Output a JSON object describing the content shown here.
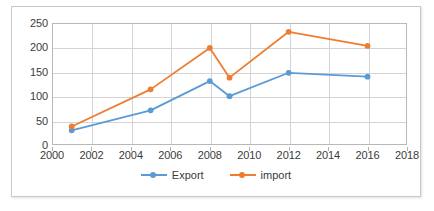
{
  "chart_data": {
    "type": "line",
    "title": "",
    "subtitle": "",
    "xlabel": "",
    "ylabel": "",
    "xlim": [
      2000,
      2018
    ],
    "ylim": [
      0,
      250
    ],
    "xticks": [
      2000,
      2002,
      2004,
      2006,
      2008,
      2010,
      2012,
      2014,
      2016,
      2018
    ],
    "yticks": [
      0,
      50,
      100,
      150,
      200,
      250
    ],
    "grid": "both",
    "legend_position": "bottom",
    "x": [
      2001,
      2005,
      2008,
      2009,
      2012,
      2016
    ],
    "series": [
      {
        "name": "Export",
        "color": "#5B9BD5",
        "values": [
          30,
          71,
          131,
          100,
          148,
          140
        ]
      },
      {
        "name": "import",
        "color": "#ED7D31",
        "values": [
          38,
          114,
          199,
          138,
          232,
          203
        ]
      }
    ]
  },
  "axes": {
    "y_tick_labels": [
      "250",
      "200",
      "150",
      "100",
      "50",
      "0"
    ],
    "x_tick_labels": [
      "2000",
      "2002",
      "2004",
      "2006",
      "2008",
      "2010",
      "2012",
      "2014",
      "2016",
      "2018"
    ]
  },
  "legend": {
    "items": [
      {
        "label": "Export",
        "color": "#5B9BD5"
      },
      {
        "label": "import",
        "color": "#ED7D31"
      }
    ]
  },
  "colors": {
    "export_series": "#5B9BD5",
    "import_series": "#ED7D31",
    "gridline": "#D4D4D4",
    "axis": "#B8B8B8",
    "text": "#3B3B3B",
    "frame": "#C9C9C9",
    "background": "#FFFFFF"
  }
}
